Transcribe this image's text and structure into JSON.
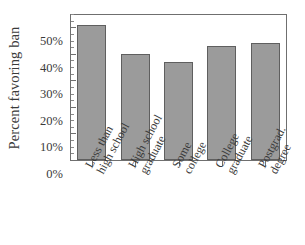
{
  "chart_data": {
    "type": "bar",
    "title": "",
    "xlabel": "",
    "ylabel": "Percent favoring ban",
    "categories": [
      "Less than high school",
      "High school graduate",
      "Some college",
      "College graduate",
      "Postgrad. degree"
    ],
    "category_lines": [
      [
        "Less than",
        "high school"
      ],
      [
        "High school",
        "graduate"
      ],
      [
        "Some",
        "college"
      ],
      [
        "College",
        "graduate"
      ],
      [
        "Postgrad.",
        "degree"
      ]
    ],
    "values": [
      51,
      40,
      37,
      43,
      44
    ],
    "value_labels": [
      "51%",
      "40%",
      "37%",
      "43%",
      "44%"
    ],
    "ylim": [
      0,
      55
    ],
    "yticks": [
      0,
      10,
      20,
      30,
      40,
      50
    ],
    "ytick_labels": [
      "0%",
      "10%",
      "20%",
      "30%",
      "40%",
      "50%"
    ],
    "yminor_step": 2.5,
    "grid": false,
    "legend": null,
    "bar_color": "#9b9b9b",
    "bar_edge_color": "#5f5f5f",
    "axis_color": "#6f6f6f",
    "text_color": "#3a3a3a",
    "background": "#ffffff",
    "xtick_label_rotation": -62
  }
}
